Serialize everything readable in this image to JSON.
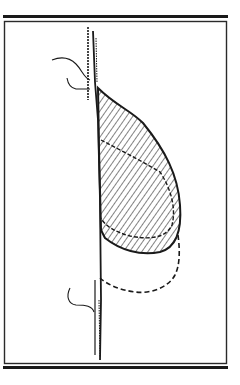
{
  "figure": {
    "type": "line-drawing",
    "colors": {
      "background": "#ffffff",
      "ink": "#1a1a1a",
      "frame": "#2a2a2a"
    },
    "elements": [
      "top-rule",
      "frame-box",
      "bottom-rule",
      "chest-wall-line",
      "upper-skin-curve",
      "lower-skin-curve",
      "hatched-breast-region",
      "inner-contour",
      "dashed-outline"
    ]
  }
}
